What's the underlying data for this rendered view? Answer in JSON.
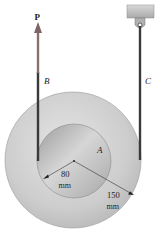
{
  "diagram": {
    "type": "stepped-pulley",
    "labels": {
      "force": "P",
      "cable_left": "B",
      "cable_right": "C",
      "pulley_center": "A",
      "inner_radius_value": "80",
      "inner_radius_unit": "mm",
      "outer_radius_value": "150",
      "outer_radius_unit": "mm"
    },
    "colors": {
      "outer_disk": "#c9c9c9",
      "inner_disk": "#b3b3b3",
      "cable": "#3a3a3a",
      "arrow": "#8a6f6f",
      "support": "#c2c2c2",
      "background": "#ffffff"
    },
    "geometry": {
      "outer_radius_mm": 150,
      "inner_radius_mm": 80
    }
  }
}
